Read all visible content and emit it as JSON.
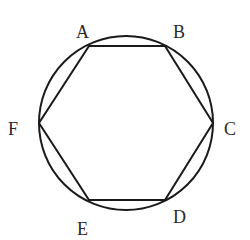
{
  "diagram": {
    "stroke_color": "#1a1a1a",
    "label_color": "#2a2a2a",
    "background": "#ffffff",
    "circle": {
      "cx": 126,
      "cy": 123,
      "r": 87
    },
    "vertices": [
      {
        "name": "A",
        "x": 89,
        "y": 46,
        "label_x": 76,
        "label_y": 38
      },
      {
        "name": "B",
        "x": 165,
        "y": 46,
        "label_x": 173,
        "label_y": 38
      },
      {
        "name": "C",
        "x": 213,
        "y": 123,
        "label_x": 224,
        "label_y": 135
      },
      {
        "name": "D",
        "x": 165,
        "y": 200,
        "label_x": 173,
        "label_y": 223
      },
      {
        "name": "E",
        "x": 89,
        "y": 200,
        "label_x": 77,
        "label_y": 235
      },
      {
        "name": "F",
        "x": 39,
        "y": 123,
        "label_x": 8,
        "label_y": 135
      }
    ]
  },
  "labels": {
    "A": "A",
    "B": "B",
    "C": "C",
    "D": "D",
    "E": "E",
    "F": "F"
  }
}
